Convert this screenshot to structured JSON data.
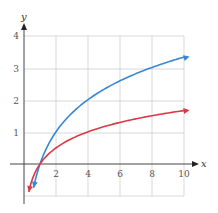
{
  "chart_data": {
    "type": "line",
    "title": "",
    "xlabel": "x",
    "ylabel": "y",
    "xlim": [
      0,
      10
    ],
    "ylim": [
      -1,
      4
    ],
    "grid": true,
    "x_ticks": [
      "2",
      "4",
      "6",
      "8",
      "10"
    ],
    "y_ticks": [
      "1",
      "2",
      "3",
      "4"
    ],
    "series": [
      {
        "name": "blue curve (y = log2 x)",
        "color": "#3a86d4",
        "x": [
          0.6,
          1,
          2,
          4,
          6,
          8,
          10
        ],
        "values": [
          -0.74,
          0,
          1,
          2,
          2.58,
          3,
          3.32
        ]
      },
      {
        "name": "red curve (y = log4 x)",
        "color": "#d93a45",
        "x": [
          0.3,
          1,
          2,
          4,
          6,
          8,
          10
        ],
        "values": [
          -0.87,
          0,
          0.5,
          1,
          1.29,
          1.5,
          1.66
        ]
      }
    ]
  },
  "axes": {
    "x_label": "x",
    "y_label": "y",
    "x_tick_labels": [
      "2",
      "4",
      "6",
      "8",
      "10"
    ],
    "y_tick_labels": [
      "1",
      "2",
      "3",
      "4"
    ]
  }
}
